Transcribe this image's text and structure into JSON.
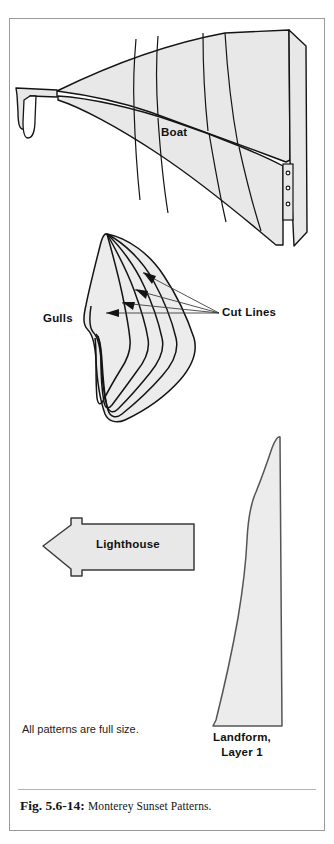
{
  "figure": {
    "caption_number": "Fig. 5.6-14:",
    "caption_text": "Monterey Sunset Patterns.",
    "note": "All patterns are full size.",
    "frame_border_color": "#9a9a9a",
    "background_color": "#ffffff"
  },
  "labels": {
    "boat": "Boat",
    "gulls": "Gulls",
    "cut_lines": "Cut Lines",
    "lighthouse": "Lighthouse",
    "landform_line1": "Landform,",
    "landform_line2": "Layer 1"
  },
  "patterns": [
    {
      "id": "boat",
      "name": "Boat",
      "label": "Boat",
      "fill": "#e8e8e8",
      "stroke": "#141414",
      "description": "Large curved sail-and-hull silhouette with internal cut segment lines and a mast strip containing three small circles"
    },
    {
      "id": "gulls",
      "name": "Gulls",
      "label": "Gulls",
      "fill": "#ececec",
      "stroke": "#141414",
      "description": "Nested gull wing silhouettes with four cut lines indicated by arrows"
    },
    {
      "id": "lighthouse",
      "name": "Lighthouse",
      "label": "Lighthouse",
      "fill": "#e8e8e8",
      "stroke": "#3a3a3a",
      "description": "Horizontal tapering arrow-like lighthouse body with small square gallery tabs"
    },
    {
      "id": "landform",
      "name": "Landform, Layer 1",
      "label": "Landform,\nLayer 1",
      "fill": "#ececec",
      "stroke": "#555555",
      "description": "Tall curved coastal landform profile, layer one"
    }
  ],
  "annotations": {
    "cut_line_count": 4,
    "mast_circle_count": 3
  }
}
